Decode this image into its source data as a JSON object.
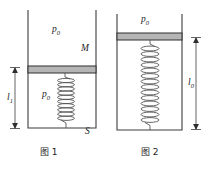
{
  "figure": {
    "background_color": "#ffffff",
    "line_color": "#3d3d3d",
    "piston_fill_color": "#b5b5b5",
    "spring_color": "#555555"
  },
  "fig1": {
    "caption": "图 1",
    "labels": {
      "pressure_outside": "p",
      "pressure_outside_sub": "0",
      "pressure_inside": "p",
      "pressure_inside_sub": "0",
      "piston_mass": "M",
      "cross_section": "S",
      "length": "l",
      "length_sub": "1"
    },
    "geometry": {
      "wall_left_x": 28,
      "wall_right_x": 96,
      "wall_top_y": 10,
      "wall_bottom_y": 128,
      "piston_top_y": 66,
      "piston_bottom_y": 73,
      "spring_coils": 11,
      "dimension_x": 15,
      "dimension_top_y": 68,
      "dimension_bottom_y": 128
    }
  },
  "fig2": {
    "caption": "图 2",
    "labels": {
      "pressure_outside": "p",
      "pressure_outside_sub": "0",
      "length": "l",
      "length_sub": "0"
    },
    "geometry": {
      "wall_left_x": 117,
      "wall_right_x": 182,
      "wall_top_y": 14,
      "wall_bottom_y": 130,
      "piston_top_y": 33,
      "piston_bottom_y": 40,
      "spring_coils": 15,
      "dimension_x": 196,
      "dimension_top_y": 38,
      "dimension_bottom_y": 129
    }
  }
}
